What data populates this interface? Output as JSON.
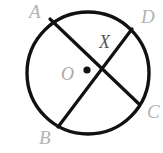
{
  "figure": {
    "kind": "circle-with-intersecting-chords",
    "canvas": {
      "width": 163,
      "height": 153,
      "background": "#ffffff"
    },
    "circle": {
      "name": "main-circle",
      "center_x": 88,
      "center_y": 73,
      "radius": 61,
      "stroke": "#111111",
      "stroke_width": 3.4,
      "fill": "none"
    },
    "center_point": {
      "name": "center-dot",
      "x": 87,
      "y": 70,
      "radius": 3.6,
      "color": "#111111"
    },
    "chords": [
      {
        "name": "chord-AC",
        "from_label": "A",
        "to_label": "C",
        "x1": 50,
        "y1": 19,
        "x2": 139,
        "y2": 104,
        "stroke": "#111111",
        "stroke_width": 3.2
      },
      {
        "name": "chord-BD",
        "from_label": "B",
        "to_label": "D",
        "x1": 58,
        "y1": 127,
        "x2": 132,
        "y2": 29,
        "stroke": "#111111",
        "stroke_width": 3.2
      }
    ],
    "intersection": {
      "name": "point-X",
      "x": 110,
      "y": 67
    },
    "labels": {
      "A": "A",
      "B": "B",
      "C": "C",
      "D": "D",
      "X": "X",
      "O": "O"
    },
    "label_colors": {
      "outer": "#b3b3b3",
      "intersection": "#555555",
      "center": "#a8a8a8"
    }
  }
}
